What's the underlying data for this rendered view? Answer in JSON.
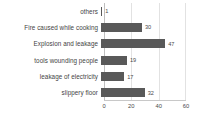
{
  "chart_data": {
    "type": "bar",
    "orientation": "horizontal",
    "title": "",
    "xlabel": "",
    "ylabel": "",
    "categories": [
      "others",
      "Fire caused while cooking",
      "Explosion and leakage",
      "tools wounding people",
      "leakage of electricity",
      "slippery floor"
    ],
    "values": [
      1,
      30,
      47,
      19,
      17,
      32
    ],
    "xlim": [
      0,
      60
    ],
    "xticks": [
      0,
      20,
      40,
      60
    ],
    "xtick_labels": [
      "0",
      "20",
      "40",
      "60"
    ],
    "grid": true,
    "grid_axis": "x",
    "legend": false,
    "data_labels": [
      "1",
      "30",
      "47",
      "19",
      "17",
      "32"
    ],
    "colors": {
      "bar": "#595959",
      "grid": "#e2e2e2",
      "axis": "#c8c8c8",
      "text": "#4a4a4a",
      "background": "#ffffff"
    }
  }
}
